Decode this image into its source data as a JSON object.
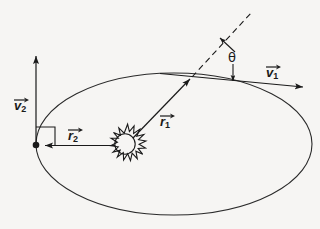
{
  "figure": {
    "background_color": "#f6f5f3",
    "stroke_color": "#1a1a1a"
  },
  "labels": {
    "v1": {
      "base": "v",
      "sub": "1",
      "icon": "vector-arrow-overline"
    },
    "v2": {
      "base": "v",
      "sub": "2",
      "icon": "vector-arrow-overline"
    },
    "r1": {
      "base": "r",
      "sub": "1",
      "icon": "vector-arrow-overline"
    },
    "r2": {
      "base": "r",
      "sub": "2",
      "icon": "vector-arrow-overline"
    },
    "theta": {
      "symbol": "θ"
    }
  },
  "elements": {
    "orbit": "ellipse-orbit",
    "sun": "sun-icon",
    "apoapsis_point": "orbit-point-marker",
    "right_angle": "right-angle-marker",
    "tangent_line": "tangent-velocity-line",
    "dashed_line": "radial-extension-dashed-line",
    "angle_arc": "theta-angle-indicator"
  },
  "geometry": {
    "ellipse": {
      "cx": 174,
      "cy": 144,
      "rx": 138,
      "ry": 71
    },
    "sun": {
      "cx": 125,
      "cy": 145,
      "r": 10,
      "spikes": 16
    },
    "point": {
      "x": 36,
      "y": 145
    },
    "intersection": {
      "x": 192,
      "y": 77
    }
  }
}
